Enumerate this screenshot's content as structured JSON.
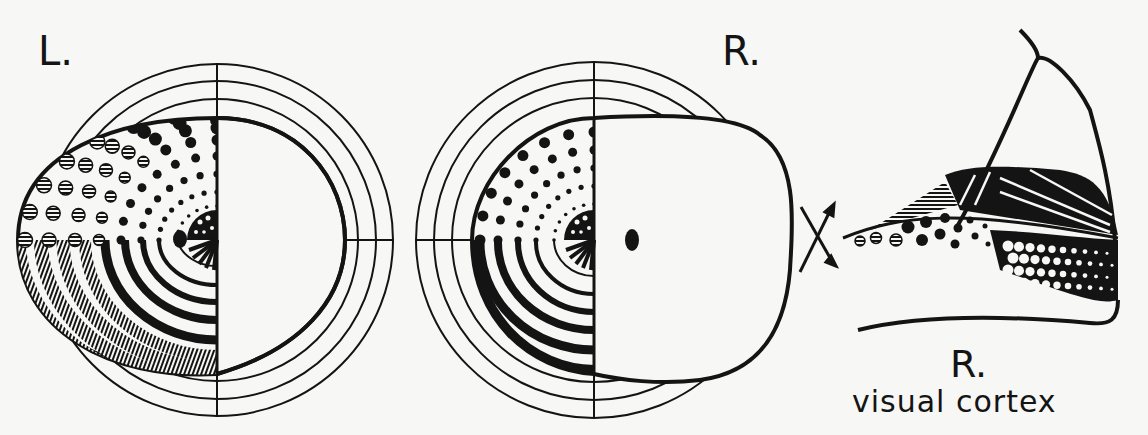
{
  "figure": {
    "type": "visual field to visual cortex projection diagram",
    "labels": {
      "left_eye": "L.",
      "right_eye": "R.",
      "cortex_side": "R.",
      "cortex": "visual cortex"
    },
    "colors": {
      "ink": "#141414",
      "paper": "#f7f7f5"
    },
    "left_field": {
      "center": [
        217,
        240
      ],
      "ring_radii": [
        141,
        159,
        176
      ],
      "outline": "left eye visual field with temporal crescent",
      "blind_spot": [
        180,
        239
      ]
    },
    "right_field": {
      "center": [
        594,
        240
      ],
      "ring_radii": [
        142,
        160,
        178
      ],
      "outline": "right eye visual field",
      "blind_spot": [
        632,
        240
      ]
    },
    "chiasm_symbol": "X",
    "cortex": {
      "description": "right visual cortex with calcarine fissure mapping"
    }
  }
}
